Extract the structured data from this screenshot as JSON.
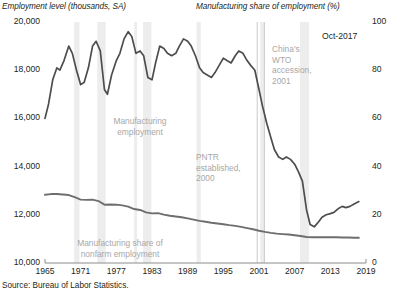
{
  "chart_data": {
    "type": "line",
    "title": "",
    "left_axis": {
      "label": "Employment level (thousands, SA)",
      "ticks": [
        "20,000",
        "18,000",
        "16,000",
        "14,000",
        "12,000",
        "10,000"
      ],
      "tick_values": [
        20000,
        18000,
        16000,
        14000,
        12000,
        10000
      ],
      "ylim": [
        10000,
        20000
      ]
    },
    "right_axis": {
      "label": "Manufacturing share of employment (%)",
      "ticks": [
        "100",
        "80",
        "60",
        "40",
        "20",
        "0"
      ],
      "tick_values": [
        100,
        80,
        60,
        40,
        20,
        0
      ],
      "ylim": [
        0,
        100
      ]
    },
    "xlabel": "",
    "x_ticks": [
      "1965",
      "1971",
      "1977",
      "1983",
      "1989",
      "1995",
      "2001",
      "2007",
      "2013",
      "2019"
    ],
    "x_tick_values": [
      1965,
      1971,
      1977,
      1983,
      1989,
      1995,
      2001,
      2007,
      2013,
      2019
    ],
    "xlim": [
      1965,
      2019
    ],
    "grid": false,
    "legend_position": "inline-annotations",
    "series": [
      {
        "name": "Manufacturing employment",
        "axis": "left",
        "color": "#4d4d4d",
        "units": "thousands",
        "x": [
          1965.0,
          1965.6,
          1966.3,
          1967.0,
          1967.5,
          1968.2,
          1969.0,
          1969.6,
          1970.3,
          1971.0,
          1971.6,
          1972.3,
          1973.0,
          1973.6,
          1974.3,
          1975.0,
          1975.5,
          1976.2,
          1977.0,
          1977.6,
          1978.3,
          1979.0,
          1979.6,
          1980.3,
          1981.0,
          1981.6,
          1982.3,
          1983.0,
          1983.6,
          1984.3,
          1985.0,
          1985.6,
          1986.3,
          1987.0,
          1987.6,
          1988.3,
          1989.0,
          1989.6,
          1990.3,
          1991.0,
          1991.6,
          1992.3,
          1993.0,
          1993.6,
          1994.3,
          1995.0,
          1995.6,
          1996.3,
          1997.0,
          1997.6,
          1998.3,
          1999.0,
          1999.6,
          2000.3,
          2001.0,
          2001.6,
          2002.3,
          2003.0,
          2003.6,
          2004.3,
          2005.0,
          2005.6,
          2006.3,
          2007.0,
          2007.6,
          2008.3,
          2009.0,
          2009.6,
          2010.3,
          2011.0,
          2011.6,
          2012.3,
          2013.0,
          2013.6,
          2014.3,
          2015.0,
          2015.6,
          2016.3,
          2017.0,
          2017.8
        ],
        "y": [
          16000,
          16600,
          17600,
          18100,
          18000,
          18400,
          19000,
          18700,
          18000,
          17400,
          17500,
          18100,
          19000,
          19200,
          18800,
          17200,
          17000,
          17800,
          18400,
          18700,
          19300,
          19600,
          19400,
          18700,
          18800,
          18600,
          17700,
          17600,
          18300,
          19000,
          18900,
          18700,
          18600,
          18700,
          19000,
          19300,
          19200,
          19000,
          18600,
          18100,
          17900,
          17800,
          17700,
          17900,
          18200,
          18500,
          18400,
          18300,
          18600,
          18800,
          18700,
          18400,
          18200,
          18000,
          17200,
          16500,
          15800,
          15200,
          14700,
          14400,
          14300,
          14400,
          14300,
          14100,
          13800,
          13400,
          12200,
          11600,
          11500,
          11700,
          11900,
          12000,
          12050,
          12100,
          12250,
          12350,
          12300,
          12350,
          12450,
          12550
        ]
      },
      {
        "name": "Manufacturing share of nonfarm employment",
        "axis": "right",
        "color": "#6e6e6e",
        "units": "percent",
        "x": [
          1965.0,
          1966.0,
          1967.0,
          1968.0,
          1969.0,
          1970.0,
          1971.0,
          1972.0,
          1973.0,
          1974.0,
          1975.0,
          1976.0,
          1977.0,
          1978.0,
          1979.0,
          1980.0,
          1981.0,
          1982.0,
          1983.0,
          1984.0,
          1985.0,
          1986.0,
          1987.0,
          1988.0,
          1989.0,
          1990.0,
          1991.0,
          1992.0,
          1993.0,
          1994.0,
          1995.0,
          1996.0,
          1997.0,
          1998.0,
          1999.0,
          2000.0,
          2001.0,
          2002.0,
          2003.0,
          2004.0,
          2005.0,
          2006.0,
          2007.0,
          2008.0,
          2009.0,
          2010.0,
          2011.0,
          2012.0,
          2013.0,
          2014.0,
          2015.0,
          2016.0,
          2017.0,
          2017.8
        ],
        "y": [
          28.3,
          28.6,
          28.6,
          28.4,
          28.2,
          27.3,
          26.3,
          26.2,
          26.3,
          25.7,
          24.2,
          24.3,
          24.2,
          23.9,
          23.4,
          22.4,
          22.0,
          21.0,
          20.6,
          20.7,
          20.1,
          19.6,
          19.3,
          19.0,
          18.5,
          18.0,
          17.5,
          17.1,
          16.7,
          16.4,
          16.1,
          15.7,
          15.4,
          15.0,
          14.5,
          14.0,
          13.4,
          12.9,
          12.5,
          12.2,
          12.0,
          11.8,
          11.5,
          11.2,
          10.8,
          10.7,
          10.7,
          10.7,
          10.7,
          10.7,
          10.6,
          10.6,
          10.5,
          10.5
        ]
      }
    ],
    "recession_bands": [
      {
        "start": 1969.9,
        "end": 1970.8
      },
      {
        "start": 1973.8,
        "end": 1975.2
      },
      {
        "start": 1980.0,
        "end": 1980.5
      },
      {
        "start": 1981.5,
        "end": 1982.9
      },
      {
        "start": 1990.5,
        "end": 1991.2
      },
      {
        "start": 2001.2,
        "end": 2001.9
      },
      {
        "start": 2007.9,
        "end": 2009.4
      }
    ],
    "event_markers": [
      {
        "label": "PNTR established, 2000",
        "x": 2000.7
      },
      {
        "label": "China's WTO accession, 2001",
        "x": 2001.9
      }
    ],
    "annotations": [
      {
        "name": "manufacturing-employment",
        "text": "Manufacturing\nemployment"
      },
      {
        "name": "pntr",
        "text": "PNTR\nestablished,\n2000"
      },
      {
        "name": "wto",
        "text": "China's\nWTO\naccession,\n2001"
      },
      {
        "name": "manufacturing-share",
        "text": "Manufacturing share of\nnonfarm employment"
      }
    ],
    "date_label": "Oct-2017",
    "source": "Source: Bureau of Labor Statistics."
  },
  "labels": {
    "left_axis_title": "Employment level (thousands, SA)",
    "right_axis_title": "Manufacturing share of employment (%)",
    "date_badge": "Oct-2017",
    "source": "Source: Bureau of Labor Statistics.",
    "annot_mfg_emp_line1": "Manufacturing",
    "annot_mfg_emp_line2": "employment",
    "annot_pntr_line1": "PNTR",
    "annot_pntr_line2": "established,",
    "annot_pntr_line3": "2000",
    "annot_wto_line1": "China's",
    "annot_wto_line2": "WTO",
    "annot_wto_line3": "accession,",
    "annot_wto_line4": "2001",
    "annot_share_line1": "Manufacturing share of",
    "annot_share_line2": "nonfarm employment"
  },
  "colors": {
    "employment_line": "#4d4d4d",
    "share_line": "#6e6e6e",
    "recession_band": "#ededed",
    "event_marker": "#c9c9c9",
    "axis": "#8c8c8c",
    "text": "#231f20",
    "annotation_text": "#a8a8a8"
  }
}
